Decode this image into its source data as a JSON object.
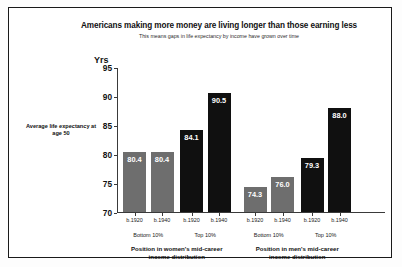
{
  "chart_data": {
    "type": "bar",
    "title": "Americans making more money are living longer than those earning less",
    "subtitle": "This means gaps in life expectancy by income have grown over time",
    "ylabel": "Yrs",
    "xlabel": "",
    "ylim": [
      70,
      95
    ],
    "yticks": [
      70,
      75,
      80,
      85,
      90,
      95
    ],
    "grid": false,
    "legend": "none",
    "side_annotation": "Average life expectancy at age 50",
    "groups": [
      {
        "name": "Position in women's mid-career income distribution",
        "subgroups": [
          {
            "label": "Bottom 10%",
            "bars": [
              {
                "label": "b.1920",
                "value": 80.4,
                "display": "80.4",
                "color": "#6e6e6e",
                "color_name": "gray"
              },
              {
                "label": "b.1940",
                "value": 80.4,
                "display": "80.4",
                "color": "#6e6e6e",
                "color_name": "gray"
              }
            ]
          },
          {
            "label": "Top 10%",
            "bars": [
              {
                "label": "b.1920",
                "value": 84.1,
                "display": "84.1",
                "color": "#101010",
                "color_name": "black"
              },
              {
                "label": "b.1940",
                "value": 90.5,
                "display": "90.5",
                "color": "#101010",
                "color_name": "black"
              }
            ]
          }
        ]
      },
      {
        "name": "Position in men's mid-career income distribution",
        "subgroups": [
          {
            "label": "Bottom 10%",
            "bars": [
              {
                "label": "b.1920",
                "value": 74.3,
                "display": "74.3",
                "color": "#6e6e6e",
                "color_name": "gray"
              },
              {
                "label": "b.1940",
                "value": 76.0,
                "display": "76.0",
                "color": "#6e6e6e",
                "color_name": "gray"
              }
            ]
          },
          {
            "label": "Top 10%",
            "bars": [
              {
                "label": "b.1920",
                "value": 79.3,
                "display": "79.3",
                "color": "#101010",
                "color_name": "black"
              },
              {
                "label": "b.1940",
                "value": 88.0,
                "display": "88.0",
                "color": "#101010",
                "color_name": "black"
              }
            ]
          }
        ]
      }
    ]
  }
}
